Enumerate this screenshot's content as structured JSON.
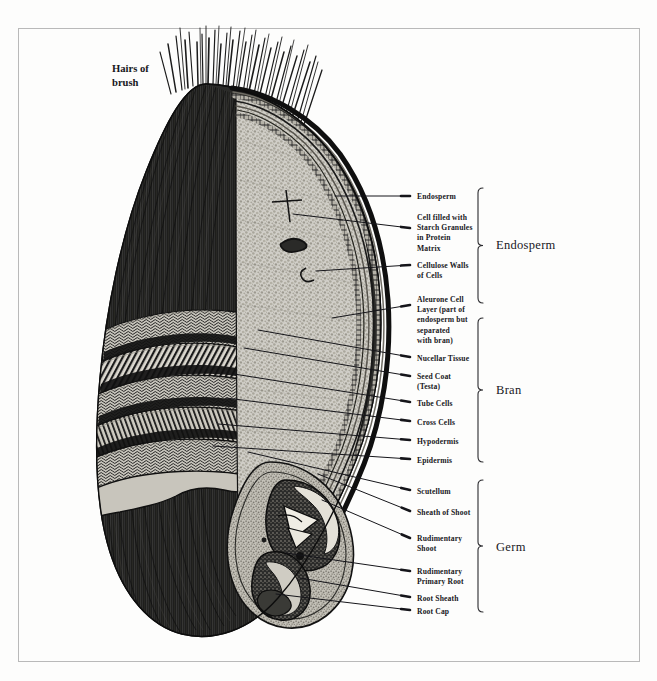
{
  "figure": {
    "title_visible": false,
    "background_color": "#fdfdfc",
    "ink_color": "#17171b",
    "frame_color": "#b9b9b9"
  },
  "annotations": {
    "brush": {
      "label": "Hairs of\nbrush",
      "x": 112,
      "y": 62
    }
  },
  "callouts": [
    {
      "id": "endosperm",
      "label": "Endosperm",
      "text_x": 417,
      "text_y": 192,
      "leader_x1": 410,
      "leader_y1": 196,
      "leader_x2": 335,
      "leader_y2": 196
    },
    {
      "id": "starch-granules",
      "label": "Cell filled with\nStarch Granules\nin Protein\nMatrix",
      "text_x": 417,
      "text_y": 213,
      "leader_x1": 410,
      "leader_y1": 228,
      "leader_x2": 293,
      "leader_y2": 214
    },
    {
      "id": "cellulose-walls",
      "label": "Cellulose Walls\nof Cells",
      "text_x": 417,
      "text_y": 261,
      "leader_x1": 410,
      "leader_y1": 265,
      "leader_x2": 316,
      "leader_y2": 271
    },
    {
      "id": "aleurone-layer",
      "label": "Aleurone Cell\nLayer (part of\nendosperm but\nseparated\nwith bran)",
      "text_x": 417,
      "text_y": 295,
      "leader_x1": 410,
      "leader_y1": 305,
      "leader_x2": 332,
      "leader_y2": 318
    },
    {
      "id": "nucellar-tissue",
      "label": "Nucellar Tissue",
      "text_x": 417,
      "text_y": 354,
      "leader_x1": 410,
      "leader_y1": 357,
      "leader_x2": 258,
      "leader_y2": 330
    },
    {
      "id": "seed-coat",
      "label": "Seed Coat\n(Testa)",
      "text_x": 417,
      "text_y": 372,
      "leader_x1": 410,
      "leader_y1": 376,
      "leader_x2": 244,
      "leader_y2": 348
    },
    {
      "id": "tube-cells",
      "label": "Tube Cells",
      "text_x": 417,
      "text_y": 399,
      "leader_x1": 410,
      "leader_y1": 402,
      "leader_x2": 234,
      "leader_y2": 374
    },
    {
      "id": "cross-cells",
      "label": "Cross Cells",
      "text_x": 417,
      "text_y": 418,
      "leader_x1": 410,
      "leader_y1": 421,
      "leader_x2": 226,
      "leader_y2": 398
    },
    {
      "id": "hypodermis",
      "label": "Hypodermis",
      "text_x": 417,
      "text_y": 437,
      "leader_x1": 410,
      "leader_y1": 440,
      "leader_x2": 218,
      "leader_y2": 424
    },
    {
      "id": "epidermis",
      "label": "Epidermis",
      "text_x": 417,
      "text_y": 456,
      "leader_x1": 410,
      "leader_y1": 459,
      "leader_x2": 213,
      "leader_y2": 446
    },
    {
      "id": "scutellum",
      "label": "Scutellum",
      "text_x": 417,
      "text_y": 487,
      "leader_x1": 410,
      "leader_y1": 490,
      "leader_x2": 248,
      "leader_y2": 452
    },
    {
      "id": "sheath-of-shoot",
      "label": "Sheath of Shoot",
      "text_x": 417,
      "text_y": 508,
      "leader_x1": 410,
      "leader_y1": 511,
      "leader_x2": 318,
      "leader_y2": 474
    },
    {
      "id": "rudimentary-shoot",
      "label": "Rudimentary\nShoot",
      "text_x": 417,
      "text_y": 534,
      "leader_x1": 410,
      "leader_y1": 538,
      "leader_x2": 322,
      "leader_y2": 500
    },
    {
      "id": "rudimentary-root",
      "label": "Rudimentary\nPrimary Root",
      "text_x": 417,
      "text_y": 567,
      "leader_x1": 410,
      "leader_y1": 571,
      "leader_x2": 286,
      "leader_y2": 553
    },
    {
      "id": "root-sheath",
      "label": "Root Sheath",
      "text_x": 417,
      "text_y": 594,
      "leader_x1": 410,
      "leader_y1": 597,
      "leader_x2": 300,
      "leader_y2": 578
    },
    {
      "id": "root-cap",
      "label": "Root Cap",
      "text_x": 417,
      "text_y": 607,
      "leader_x1": 410,
      "leader_y1": 610,
      "leader_x2": 276,
      "leader_y2": 594
    }
  ],
  "groups": [
    {
      "id": "endosperm-group",
      "label": "Endosperm",
      "bracket_x": 478,
      "bracket_top": 188,
      "bracket_bottom": 303,
      "text_x": 496,
      "text_y": 238
    },
    {
      "id": "bran-group",
      "label": "Bran",
      "bracket_x": 478,
      "bracket_top": 318,
      "bracket_bottom": 462,
      "text_x": 496,
      "text_y": 383
    },
    {
      "id": "germ-group",
      "label": "Germ",
      "bracket_x": 478,
      "bracket_top": 480,
      "bracket_bottom": 612,
      "text_x": 496,
      "text_y": 540
    }
  ]
}
